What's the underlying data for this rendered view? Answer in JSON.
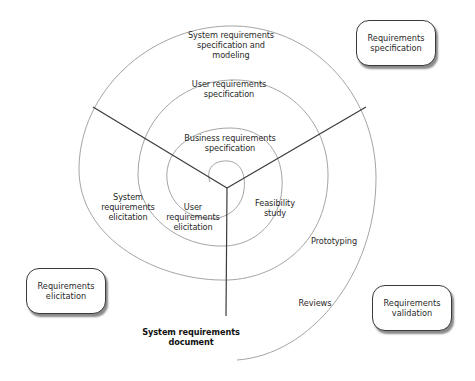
{
  "diagram": {
    "type": "spiral requirements engineering process",
    "colors": {
      "spiral_stroke": "#9a9a9a",
      "sector_line": "#3a3a3a",
      "box_border": "#3a3a3a",
      "box_shadow": "#8a8a8a",
      "text": "#2a2a2a"
    },
    "phase_boxes": [
      {
        "id": "specification",
        "label": "Requirements\nspecification"
      },
      {
        "id": "elicitation",
        "label": "Requirements\nelicitation"
      },
      {
        "id": "validation",
        "label": "Requirements\nvalidation"
      }
    ],
    "spiral_labels": {
      "system_spec_modeling": "System requirements\nspecification and\nmodeling",
      "user_spec": "User requirements\nspecification",
      "business_spec": "Business requirements\nspecification",
      "system_elicitation": "System\nrequirements\nelicitation",
      "user_elicitation": "User\nrequirements\nelicitation",
      "feasibility": "Feasibility\nstudy",
      "prototyping": "Prototyping",
      "reviews": "Reviews"
    },
    "output_label": "System requirements\ndocument"
  }
}
